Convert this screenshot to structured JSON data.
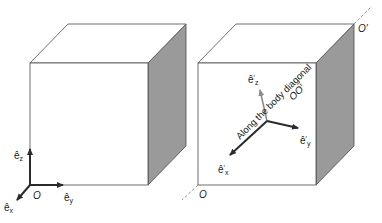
{
  "figure": {
    "left_panel": {
      "axes": {
        "ez_label": "ê",
        "ez_sub": "z",
        "ey_label": "ê",
        "ey_sub": "y",
        "ex_label": "ê",
        "ex_sub": "x",
        "origin_label": "O"
      }
    },
    "right_panel": {
      "axes": {
        "ez_label": "ê",
        "ez_sub": "z",
        "ey_label": "ê",
        "ey_sub": "y",
        "ex_label": "ê",
        "ex_sub": "x",
        "prime": "′"
      },
      "origin_label": "O",
      "far_corner_label": "O′",
      "diagonal_caption_line1": "Along the body diagonal",
      "diagonal_caption_line2": "OO′"
    },
    "colors": {
      "edge": "#4a4a4a",
      "side_face": "#9a9a9a",
      "front_face": "#ffffff",
      "axis_dark": "#2b2b2b",
      "axis_light": "#8c8c8c",
      "dashed_line": "#9a9a9a"
    }
  }
}
